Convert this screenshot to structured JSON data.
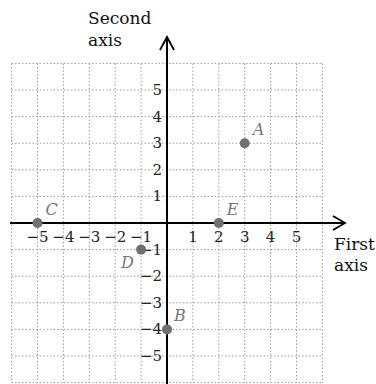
{
  "chart_data": {
    "type": "scatter",
    "title": "",
    "xlabel": "First axis",
    "ylabel": "Second axis",
    "xlim": [
      -6,
      6
    ],
    "ylim": [
      -6,
      6
    ],
    "grid": true,
    "x_ticks": [
      -5,
      -4,
      -3,
      -2,
      -1,
      1,
      2,
      3,
      4,
      5
    ],
    "y_ticks": [
      5,
      4,
      3,
      2,
      1,
      -1,
      -2,
      -3,
      -4,
      -5
    ],
    "x_tick_labels": [
      "−5",
      "−4",
      "−3",
      "−2",
      "−1",
      "1",
      "2",
      "3",
      "4",
      "5"
    ],
    "y_tick_labels": [
      "5",
      "4",
      "3",
      "2",
      "1",
      "−1",
      "−2",
      "−3",
      "−4",
      "−5"
    ],
    "points": [
      {
        "label": "A",
        "x": 3,
        "y": 3
      },
      {
        "label": "B",
        "x": 0,
        "y": -4
      },
      {
        "label": "C",
        "x": -5,
        "y": 0
      },
      {
        "label": "D",
        "x": -1,
        "y": -1
      },
      {
        "label": "E",
        "x": 2,
        "y": 0
      }
    ],
    "colors": {
      "point": "#707070",
      "axis": "#000000",
      "grid": "#999999"
    }
  },
  "labels": {
    "x_axis_line1": "First",
    "x_axis_line2": "axis",
    "y_axis_line1": "Second",
    "y_axis_line2": "axis"
  }
}
